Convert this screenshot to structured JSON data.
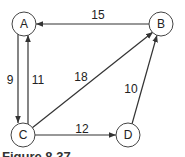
{
  "graph": {
    "type": "directed-weighted",
    "nodes": [
      {
        "id": "A",
        "label": "A"
      },
      {
        "id": "B",
        "label": "B"
      },
      {
        "id": "C",
        "label": "C"
      },
      {
        "id": "D",
        "label": "D"
      }
    ],
    "edges": [
      {
        "from": "B",
        "to": "A",
        "weight": "15"
      },
      {
        "from": "A",
        "to": "C",
        "weight": "9"
      },
      {
        "from": "C",
        "to": "A",
        "weight": "11"
      },
      {
        "from": "C",
        "to": "B",
        "weight": "18"
      },
      {
        "from": "C",
        "to": "D",
        "weight": "12"
      },
      {
        "from": "D",
        "to": "B",
        "weight": "10"
      }
    ]
  },
  "caption": "Figure 8.37"
}
